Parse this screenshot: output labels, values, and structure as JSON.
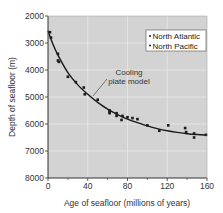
{
  "chart_data": {
    "type": "scatter",
    "title": "",
    "xlabel": "Age of seafloor (millions of years)",
    "ylabel": "Depth of seafloor (m)",
    "xlim": [
      0,
      160
    ],
    "ylim": [
      2000,
      8000
    ],
    "y_inverted": true,
    "x_ticks": [
      0,
      40,
      80,
      120,
      160
    ],
    "y_ticks": [
      2000,
      3000,
      4000,
      5000,
      6000,
      7000,
      8000
    ],
    "grid": true,
    "legend_position": "upper right",
    "legend": [
      "North Atlantic",
      "North Pacific"
    ],
    "annotations": [
      {
        "text_lines": [
          "Cooling",
          "plate model"
        ],
        "x": 82,
        "y": 4300,
        "points_to": {
          "x": 45,
          "y": 5000
        }
      }
    ],
    "series": [
      {
        "name": "Data points (North Atlantic & North Pacific)",
        "type": "scatter",
        "points": [
          {
            "x": 2,
            "y": 2600
          },
          {
            "x": 3,
            "y": 2800
          },
          {
            "x": 10,
            "y": 3400
          },
          {
            "x": 10,
            "y": 3650
          },
          {
            "x": 11,
            "y": 3700
          },
          {
            "x": 20,
            "y": 4250
          },
          {
            "x": 28,
            "y": 4450
          },
          {
            "x": 36,
            "y": 4650
          },
          {
            "x": 37,
            "y": 4900
          },
          {
            "x": 50,
            "y": 5100
          },
          {
            "x": 62,
            "y": 5500
          },
          {
            "x": 62,
            "y": 5550
          },
          {
            "x": 62,
            "y": 5600
          },
          {
            "x": 69,
            "y": 5600
          },
          {
            "x": 69,
            "y": 5700
          },
          {
            "x": 74,
            "y": 5850
          },
          {
            "x": 75,
            "y": 5700
          },
          {
            "x": 80,
            "y": 5750
          },
          {
            "x": 85,
            "y": 5780
          },
          {
            "x": 90,
            "y": 5820
          },
          {
            "x": 100,
            "y": 6050
          },
          {
            "x": 112,
            "y": 6250
          },
          {
            "x": 121,
            "y": 6050
          },
          {
            "x": 138,
            "y": 6150
          },
          {
            "x": 139,
            "y": 6300
          },
          {
            "x": 147,
            "y": 6350
          },
          {
            "x": 147,
            "y": 6500
          },
          {
            "x": 159,
            "y": 6400
          }
        ]
      },
      {
        "name": "Cooling plate model",
        "type": "line",
        "points": [
          {
            "x": 0,
            "y": 2550
          },
          {
            "x": 5,
            "y": 3050
          },
          {
            "x": 10,
            "y": 3450
          },
          {
            "x": 20,
            "y": 4100
          },
          {
            "x": 30,
            "y": 4550
          },
          {
            "x": 40,
            "y": 4900
          },
          {
            "x": 50,
            "y": 5200
          },
          {
            "x": 60,
            "y": 5450
          },
          {
            "x": 70,
            "y": 5650
          },
          {
            "x": 80,
            "y": 5820
          },
          {
            "x": 90,
            "y": 5950
          },
          {
            "x": 100,
            "y": 6070
          },
          {
            "x": 110,
            "y": 6170
          },
          {
            "x": 120,
            "y": 6250
          },
          {
            "x": 130,
            "y": 6310
          },
          {
            "x": 140,
            "y": 6360
          },
          {
            "x": 150,
            "y": 6390
          },
          {
            "x": 160,
            "y": 6410
          }
        ]
      }
    ]
  },
  "colors": {
    "plot_background": "#d3d3d3",
    "gridline": "#e8e8e8",
    "axis": "#333333",
    "point": "#1a1a1a",
    "curve": "#1a1a1a",
    "legend_background": "#ffffff"
  },
  "labels": {
    "xlabel": "Age of seafloor (millions of years)",
    "ylabel": "Depth of seafloor (m)",
    "legend_1": "North Atlantic",
    "legend_2": "North Pacific",
    "annotation_line1": "Cooling",
    "annotation_line2": "plate model"
  }
}
